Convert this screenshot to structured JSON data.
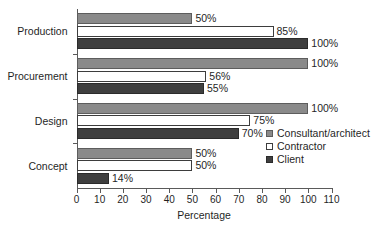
{
  "chart_data": {
    "type": "bar",
    "orientation": "horizontal",
    "title": "",
    "xlabel": "Percentage",
    "ylabel": "",
    "xlim": [
      0,
      110
    ],
    "xticks": [
      0,
      10,
      20,
      30,
      40,
      50,
      60,
      70,
      80,
      90,
      100,
      110
    ],
    "xtick_labels": [
      "0",
      "10",
      "20",
      "30",
      "40",
      "50",
      "60",
      "70",
      "80",
      "90",
      "100",
      "110"
    ],
    "grid": false,
    "legend_position": "middle-right",
    "categories": [
      "Production",
      "Procurement",
      "Design",
      "Concept"
    ],
    "series": [
      {
        "name": "Consultant/architect",
        "color": "#8a8a8a",
        "values": [
          50,
          100,
          100,
          50
        ],
        "labels": [
          "50%",
          "100%",
          "100%",
          "50%"
        ]
      },
      {
        "name": "Contractor",
        "color": "#ffffff",
        "values": [
          85,
          56,
          75,
          50
        ],
        "labels": [
          "85%",
          "56%",
          "75%",
          "50%"
        ]
      },
      {
        "name": "Client",
        "color": "#3f3f3f",
        "values": [
          100,
          55,
          70,
          14
        ],
        "labels": [
          "100%",
          "55%",
          "70%",
          "14%"
        ]
      }
    ]
  },
  "legend": {
    "items": [
      {
        "label": "Consultant/architect"
      },
      {
        "label": "Contractor"
      },
      {
        "label": "Client"
      }
    ]
  }
}
